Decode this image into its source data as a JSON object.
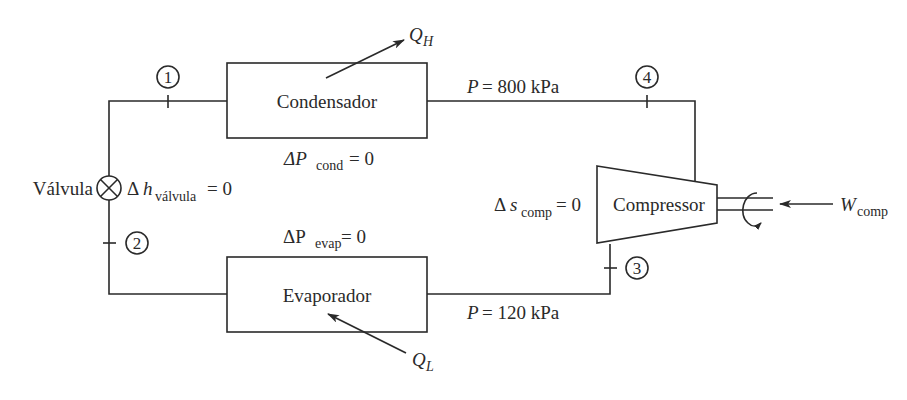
{
  "diagram": {
    "type": "refrigeration-cycle",
    "components": {
      "condenser": {
        "label": "Condensador",
        "condition_symbol": "ΔP",
        "condition_sub": "cond",
        "condition_value": "= 0"
      },
      "evaporator": {
        "label": "Evaporador",
        "condition_symbol": "ΔP",
        "condition_sub": "evap",
        "condition_value": "= 0"
      },
      "valve": {
        "label": "Válvula",
        "condition_symbol": "Δh",
        "condition_sub": "válvula",
        "condition_value": "= 0"
      },
      "compressor": {
        "label": "Compressor",
        "condition_symbol": "Δs",
        "condition_sub": "comp",
        "condition_value": "= 0"
      }
    },
    "states": [
      "1",
      "2",
      "3",
      "4"
    ],
    "pressures": {
      "high": {
        "symbol": "P",
        "value": "= 800 kPa"
      },
      "low": {
        "symbol": "P",
        "value": "= 120 kPa"
      }
    },
    "energy": {
      "q_high": {
        "symbol": "Q",
        "sub": "H"
      },
      "q_low": {
        "symbol": "Q",
        "sub": "L"
      },
      "work": {
        "symbol": "W",
        "sub": "comp"
      }
    }
  }
}
